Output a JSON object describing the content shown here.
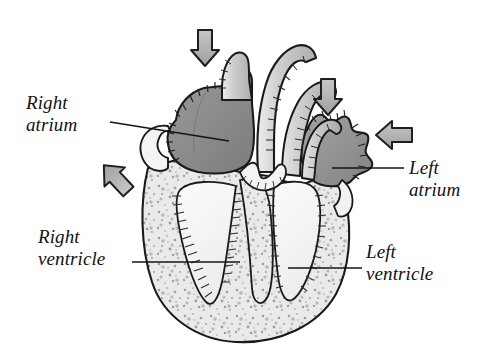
{
  "figure": {
    "background_color": "#ffffff",
    "width": 495,
    "height": 356
  },
  "labels": {
    "right_atrium": "Right\natrium",
    "left_atrium": "Left\natrium",
    "right_ventricle": "Right\nventricle",
    "left_ventricle": "Left\nventricle"
  },
  "colors": {
    "ink": "#1a1a1a",
    "atrium_fill": "#8d8d8d",
    "atrium_fill_light": "#9a9a9a",
    "vessel_fill": "#c9c9c9",
    "myocardium_fill": "#e9e9e9",
    "chamber_fill": "#f7f7f7",
    "arrow_fill": "#b4b4b4",
    "stipple": "#9d9d9d",
    "background": "#ffffff"
  },
  "arrows": [
    {
      "name": "superior-vena-cava-inflow-arrow",
      "direction": "down",
      "x": 205,
      "y": 47
    },
    {
      "name": "pulmonary-vein-inflow-arrow",
      "direction": "down",
      "x": 328,
      "y": 96
    },
    {
      "name": "left-atrium-inflow-arrow",
      "direction": "left",
      "x": 393,
      "y": 136
    },
    {
      "name": "inferior-vena-cava-inflow-arrow",
      "direction": "up-right",
      "x": 112,
      "y": 174
    }
  ],
  "leader_lines": [
    {
      "name": "right-atrium-leader",
      "x1": 110,
      "y1": 122,
      "x2": 229,
      "y2": 141
    },
    {
      "name": "left-atrium-leader",
      "x1": 332,
      "y1": 168,
      "x2": 404,
      "y2": 168
    },
    {
      "name": "right-ventricle-leader",
      "x1": 132,
      "y1": 262,
      "x2": 240,
      "y2": 262
    },
    {
      "name": "left-ventricle-leader",
      "x1": 288,
      "y1": 268,
      "x2": 362,
      "y2": 268
    }
  ],
  "anatomy": [
    {
      "name": "right-atrium-chamber",
      "label": "Right atrium"
    },
    {
      "name": "left-atrium-chamber",
      "label": "Left atrium"
    },
    {
      "name": "right-ventricle-chamber",
      "label": "Right ventricle"
    },
    {
      "name": "left-ventricle-chamber",
      "label": "Left ventricle"
    },
    {
      "name": "interventricular-septum",
      "label": "Interventricular septum"
    },
    {
      "name": "aorta-vessel",
      "label": "Aorta"
    },
    {
      "name": "pulmonary-artery-vessel",
      "label": "Pulmonary artery"
    },
    {
      "name": "superior-vena-cava-vessel",
      "label": "Superior vena cava"
    },
    {
      "name": "myocardium-wall",
      "label": "Myocardium"
    }
  ]
}
